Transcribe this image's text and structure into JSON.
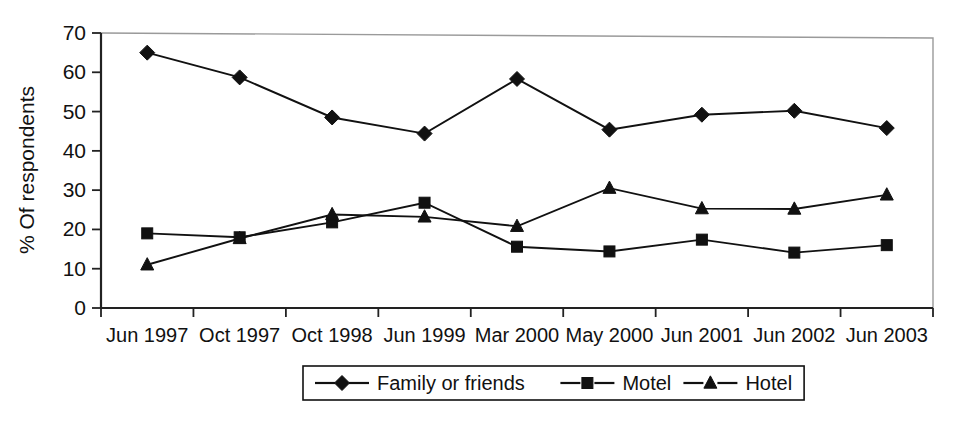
{
  "chart_data": {
    "type": "line",
    "title": "",
    "xlabel": "",
    "ylabel": "% Of respondents",
    "ylim": [
      0,
      70
    ],
    "ytick_step": 10,
    "yticks": [
      "0",
      "10",
      "20",
      "30",
      "40",
      "50",
      "60",
      "70"
    ],
    "grid": false,
    "legend_position": "bottom-center",
    "categories": [
      "Jun 1997",
      "Oct 1997",
      "Oct 1998",
      "Jun 1999",
      "Mar 2000",
      "May 2000",
      "Jun 2001",
      "Jun 2002",
      "Jun 2003"
    ],
    "series": [
      {
        "name": "Family or friends",
        "marker": "diamond",
        "values": [
          65.0,
          58.7,
          48.5,
          44.4,
          58.3,
          45.4,
          49.2,
          50.2,
          45.8
        ]
      },
      {
        "name": "Motel",
        "marker": "square",
        "values": [
          19.0,
          18.0,
          21.8,
          26.8,
          15.6,
          14.4,
          17.4,
          14.1,
          16.0
        ]
      },
      {
        "name": "Hotel",
        "marker": "triangle",
        "values": [
          11.0,
          17.7,
          23.8,
          23.2,
          20.8,
          30.5,
          25.3,
          25.2,
          28.8
        ]
      }
    ]
  },
  "colors": {
    "ink": "#111111",
    "frame": "#9a9a9a",
    "background": "#ffffff"
  }
}
